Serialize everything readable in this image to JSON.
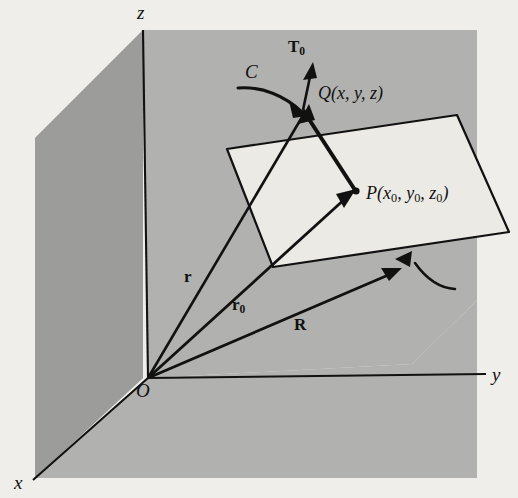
{
  "figure": {
    "type": "3d-vector-geometry-diagram",
    "background_color": "#efeeea",
    "plane_xz_color": "#9b9b99",
    "plane_yz_color": "#b0b0ae",
    "tangent_plane_color": "#e9e8e4",
    "ink_color": "#111111"
  },
  "axes": {
    "x_label": "x",
    "y_label": "y",
    "z_label": "z",
    "origin_label": "O"
  },
  "points": {
    "Q": {
      "letter": "Q",
      "coords_open": "(",
      "coord_x": "x",
      "coord_sep1": ", ",
      "coord_y": "y",
      "coord_sep2": ", ",
      "coord_z": "z",
      "coords_close": ")",
      "full": "Q(x, y, z)"
    },
    "P": {
      "letter": "P",
      "coords_open": "(",
      "coord_x": "x",
      "coord_x_sub": "0",
      "coord_sep1": ", ",
      "coord_y": "y",
      "coord_y_sub": "0",
      "coord_sep2": ", ",
      "coord_z": "z",
      "coord_z_sub": "0",
      "coords_close": ")",
      "full": "P(x0, y0, z0)"
    }
  },
  "vectors": {
    "r": {
      "label": "r",
      "from": "O",
      "to": "Q"
    },
    "r0": {
      "label": "r",
      "sub": "0",
      "from": "O",
      "to": "P"
    },
    "R": {
      "label": "R",
      "from": "O",
      "to": "tangent-plane"
    },
    "T0": {
      "label": "T",
      "sub": "0",
      "description": "unit tangent vector at Q"
    }
  },
  "curve": {
    "label": "C",
    "description": "space curve through Q"
  },
  "annotations": {
    "plane_leader": "leader curve pointing at tangent plane"
  }
}
